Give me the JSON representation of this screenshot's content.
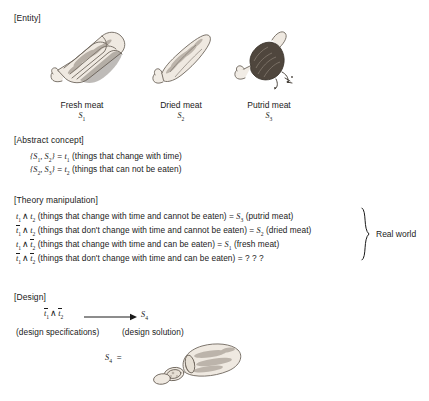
{
  "figure": {
    "sections": {
      "entity": "[Entity]",
      "abstract_concept": "[Abstract concept]",
      "theory_manipulation": "[Theory manipulation]",
      "design": "[Design]"
    },
    "entities": [
      {
        "label": "Fresh meat",
        "symbol": "S",
        "subscript": "1",
        "icon": "fresh-meat-drawing"
      },
      {
        "label": "Dried meat",
        "symbol": "S",
        "subscript": "2",
        "icon": "dried-meat-drawing"
      },
      {
        "label": "Putrid meat",
        "symbol": "S",
        "subscript": "3",
        "icon": "putrid-meat-drawing"
      }
    ],
    "abstract_concept_lines": [
      {
        "set": "{S1, S2}",
        "equals": "t1",
        "gloss": "(things that change with time)"
      },
      {
        "set": "{S2, S3}",
        "equals": "t2",
        "gloss": "(things that can not be eaten)"
      }
    ],
    "theory_lines": [
      {
        "gloss": "(things that change with time and cannot be eaten)",
        "result_text": "(putrid meat)",
        "result_sub": "3"
      },
      {
        "gloss": "(things that don't change with time and cannot be eaten)",
        "result_text": "(dried meat)",
        "result_sub": "2"
      },
      {
        "gloss": "(things that change with time and can be eaten)",
        "result_text": "(fresh meat)",
        "result_sub": "1"
      },
      {
        "gloss": "(things that don't change with time and can be eaten)",
        "result_text": "? ? ?",
        "result_sub": ""
      }
    ],
    "real_world_label": "Real world",
    "design": {
      "spec_label": "(design specifications)",
      "solution_label": "(design solution)",
      "result_symbol": "S",
      "result_subscript": "4",
      "equals": "=",
      "solution_icon": "sausage-drawing"
    },
    "symbols": {
      "wedge": "∧",
      "equals": "=",
      "question": "? ? ?",
      "open_brace": "{",
      "close_brace": "}"
    },
    "colors": {
      "ink": "#1a1a1a",
      "background": "#ffffff",
      "drawing": "#7a7168"
    }
  }
}
